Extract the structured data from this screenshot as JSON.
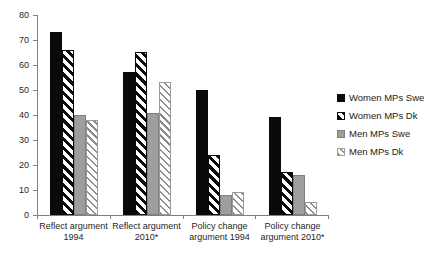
{
  "chart_data": {
    "type": "bar",
    "title": "",
    "xlabel": "",
    "ylabel": "",
    "ylim": [
      0,
      80
    ],
    "y_ticks": [
      0,
      10,
      20,
      30,
      40,
      50,
      60,
      70,
      80
    ],
    "grid": false,
    "legend_position": "right",
    "categories": [
      "Reflect argument 1994",
      "Reflect argument 2010*",
      "Policy change argument 1994",
      "Policy change argument 2010*"
    ],
    "category_label_lines": [
      [
        "Reflect argument",
        "1994"
      ],
      [
        "Reflect argument",
        "2010*"
      ],
      [
        "Policy change",
        "argument 1994"
      ],
      [
        "Policy change",
        "argument 2010*"
      ]
    ],
    "series": [
      {
        "name": "Women MPs Swe",
        "fill": "solid-black",
        "values": [
          73,
          57,
          50,
          39
        ]
      },
      {
        "name": "Women MPs Dk",
        "fill": "stripe-black",
        "values": [
          66,
          65,
          24,
          17
        ]
      },
      {
        "name": "Men MPs Swe",
        "fill": "solid-gray",
        "values": [
          40,
          41,
          8,
          16
        ]
      },
      {
        "name": "Men MPs Dk",
        "fill": "stripe-gray",
        "values": [
          38,
          53,
          9,
          5
        ]
      }
    ],
    "colors": {
      "bar_black": "#0a0a0a",
      "bar_gray": "#9e9e9e",
      "stripe_gray": "#8c8c8c",
      "axis": "#808080",
      "text": "#262626",
      "background": "#ffffff"
    }
  }
}
